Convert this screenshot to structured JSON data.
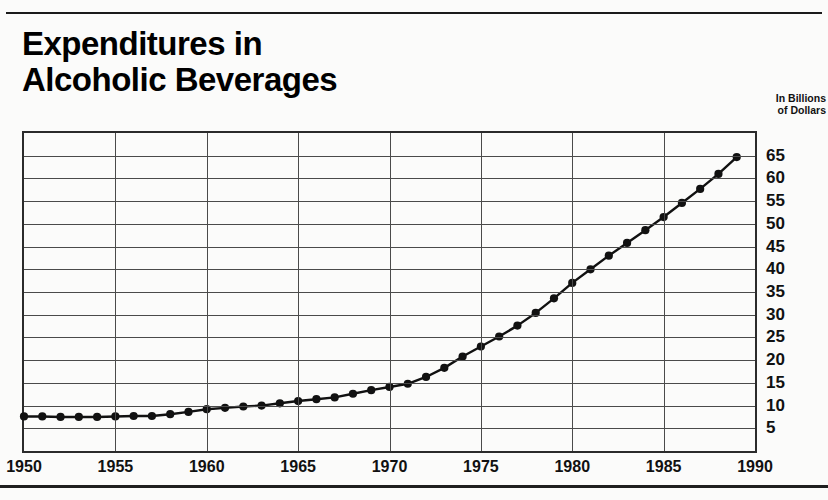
{
  "title": "Expenditures in\nAlcoholic Beverages",
  "axis_caption": "In Billions\nof Dollars",
  "chart_data": {
    "type": "line",
    "title": "Expenditures in Alcoholic Beverages",
    "subtitle": "",
    "xlabel": "",
    "ylabel": "In Billions of Dollars",
    "xlim": [
      1950,
      1990
    ],
    "ylim": [
      0,
      70
    ],
    "grid": true,
    "legend": false,
    "markers": true,
    "line_color": "#111111",
    "marker_color": "#111111",
    "xticks": [
      1950,
      1955,
      1960,
      1965,
      1970,
      1975,
      1980,
      1985,
      1990
    ],
    "xtick_labels": [
      "1950",
      "1955",
      "1960",
      "1965",
      "1970",
      "1975",
      "1980",
      "1985",
      "1990"
    ],
    "yticks": [
      5,
      10,
      15,
      20,
      25,
      30,
      35,
      40,
      45,
      50,
      55,
      60,
      65
    ],
    "ytick_labels": [
      "5",
      "10",
      "15",
      "20",
      "25",
      "30",
      "35",
      "40",
      "45",
      "50",
      "55",
      "60",
      "65"
    ],
    "x": [
      1950,
      1951,
      1952,
      1953,
      1954,
      1955,
      1956,
      1957,
      1958,
      1959,
      1960,
      1961,
      1962,
      1963,
      1964,
      1965,
      1966,
      1967,
      1968,
      1969,
      1970,
      1971,
      1972,
      1973,
      1974,
      1975,
      1976,
      1977,
      1978,
      1979,
      1980,
      1981,
      1982,
      1983,
      1984,
      1985,
      1986,
      1987,
      1988,
      1989
    ],
    "values": [
      7.6,
      7.6,
      7.5,
      7.5,
      7.5,
      7.6,
      7.7,
      7.7,
      8.1,
      8.6,
      9.2,
      9.5,
      9.8,
      10.0,
      10.5,
      11.0,
      11.4,
      11.8,
      12.6,
      13.4,
      14.1,
      14.8,
      16.3,
      18.3,
      20.8,
      23.0,
      25.2,
      27.6,
      30.4,
      33.6,
      37.0,
      40.0,
      43.0,
      45.8,
      48.6,
      51.5,
      54.6,
      57.7,
      61.0,
      64.7
    ]
  }
}
